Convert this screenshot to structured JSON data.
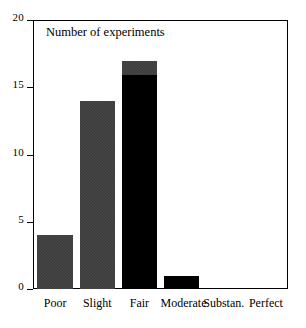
{
  "chart_data": {
    "type": "bar",
    "title": "Number of experiments",
    "xlabel": "",
    "ylabel": "",
    "categories": [
      "Poor",
      "Slight",
      "Fair",
      "Moderate",
      "Substan.",
      "Perfect"
    ],
    "values": [
      4,
      14,
      17,
      1,
      0,
      0
    ],
    "bar_colors": [
      "#3a3a3a",
      "#3a3a3a",
      "#000000",
      "#000000",
      "#000000",
      "#000000"
    ],
    "bar_cap_segments": [
      {
        "category": "Fair",
        "from": 16,
        "to": 17,
        "color": "#3a3a3a"
      }
    ],
    "ylim": [
      0,
      20
    ],
    "yticks": [
      0,
      5,
      10,
      15,
      20
    ],
    "ytick_labels": [
      "0",
      "5",
      "10",
      "15",
      "20"
    ],
    "grid": false,
    "legend": false,
    "legend_position": "none",
    "frame": "box",
    "annotations": [
      {
        "text": "Number of experiments",
        "position": "inside-top-left"
      }
    ]
  },
  "figure": {
    "title_text": "Number of experiments",
    "accent_gray": "#3a3a3a",
    "accent_black": "#000000",
    "axis_color": "#000000",
    "background": "#ffffff"
  }
}
